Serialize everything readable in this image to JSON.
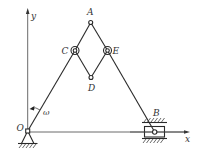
{
  "figure": {
    "type": "planar linkage mechanism (crank-slider with rhombus linkage)",
    "axes": {
      "x_label": "x",
      "y_label": "y",
      "origin_label": "O"
    },
    "points": {
      "O": {
        "label": "O",
        "x": 27.7,
        "y": 131
      },
      "A": {
        "label": "A",
        "x": 90.7,
        "y": 22.5
      },
      "C": {
        "label": "C",
        "x": 75,
        "y": 50.5
      },
      "E": {
        "label": "E",
        "x": 107.5,
        "y": 50.5
      },
      "D": {
        "label": "D",
        "x": 91,
        "y": 77.5
      },
      "B": {
        "label": "B",
        "x": 154.7,
        "y": 132
      }
    },
    "angular_velocity_label": "ω",
    "colors": {
      "line": "#2a2a2a",
      "label": "#333333",
      "background": "#ffffff"
    }
  }
}
